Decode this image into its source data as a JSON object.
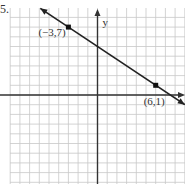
{
  "problem_number": "5.",
  "chart_data": {
    "type": "line",
    "title": "",
    "xlabel": "",
    "ylabel": "y",
    "grid": true,
    "xlim": [
      -7,
      8.5
    ],
    "ylim": [
      -9,
      9.5
    ],
    "series": [
      {
        "name": "line",
        "x": [
          -3,
          6
        ],
        "y": [
          7,
          1
        ],
        "marked_points": [
          {
            "x": -3,
            "y": 7,
            "label": "(−3,7)"
          },
          {
            "x": 6,
            "y": 1,
            "label": "(6,1)"
          }
        ],
        "slope": -0.6667,
        "y_intercept": 5,
        "arrows_both_ends": true
      }
    ],
    "annotations": [
      "(−3,7)",
      "(6,1)"
    ],
    "axis_labels": {
      "y": "y"
    }
  }
}
